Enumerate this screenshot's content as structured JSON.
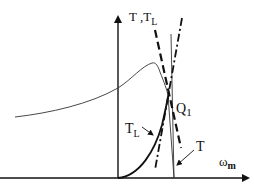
{
  "diagram": {
    "type": "torque-speed characteristic",
    "axes": {
      "y_label_main": "T ,T",
      "y_label_sub": "L",
      "x_label_main": "ω",
      "x_label_sub": "m"
    },
    "labels": {
      "operating_point_main": "Q",
      "operating_point_sub": "1",
      "load_curve_main": "T",
      "load_curve_sub": "L",
      "motor_curve": "T"
    },
    "colors": {
      "line": "#111111",
      "thin_curve": "#333333",
      "background": "#ffffff"
    }
  }
}
